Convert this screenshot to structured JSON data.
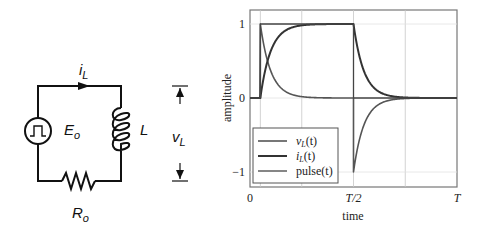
{
  "circuit": {
    "source_label": "E",
    "source_sub": "o",
    "source_icon": "pulse-source-icon",
    "inductor_label": "L",
    "resistor_label": "R",
    "resistor_sub": "o",
    "current_label": "i",
    "current_sub": "L",
    "voltage_label": "v",
    "voltage_sub": "L"
  },
  "chart_data": {
    "type": "line",
    "title": "",
    "xlabel": "time",
    "ylabel": "amplitude",
    "xlim": [
      0,
      1
    ],
    "ylim": [
      -1.2,
      1.2
    ],
    "x_ticks": [
      {
        "value": 0,
        "label": "0"
      },
      {
        "value": 0.5,
        "label": "T/2"
      },
      {
        "value": 1,
        "label": "T"
      }
    ],
    "y_ticks": [
      {
        "value": 1,
        "label": "1"
      },
      {
        "value": 0,
        "label": "0"
      },
      {
        "value": -1,
        "label": "−1"
      }
    ],
    "x_gridlines": [
      0.05,
      0.25,
      0.5,
      0.75
    ],
    "grid": true,
    "pulse_on": 0.05,
    "pulse_off": 0.5,
    "time_constant": 0.05,
    "series": [
      {
        "name": "vL(t)",
        "legend_main": "v",
        "legend_sub": "L",
        "legend_tail": "(t)",
        "color": "#555555",
        "width": 1.6,
        "description": "jumps to 1 at pulse_on then decays exponentially to 0; drops to -1 at T/2 then decays back to 0"
      },
      {
        "name": "iL(t)",
        "legend_main": "i",
        "legend_sub": "L",
        "legend_tail": "(t)",
        "color": "#333333",
        "width": 2.0,
        "description": "rises exponentially from 0 toward 1 after pulse_on; decays exponentially from 1 to 0 after T/2"
      },
      {
        "name": "pulse(t)",
        "legend_main": "pulse",
        "legend_sub": "",
        "legend_tail": "(t)",
        "color": "#444444",
        "width": 1.3,
        "description": "rectangular pulse: 0, then 1 from pulse_on to T/2, then 0"
      }
    ],
    "legend_position": "lower left"
  }
}
